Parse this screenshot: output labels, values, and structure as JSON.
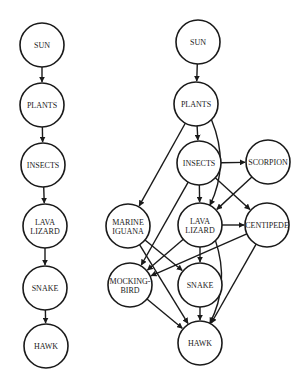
{
  "diagram": {
    "colors": {
      "stroke": "#1a1a1a",
      "background": "#ffffff",
      "node_fill": "#ffffff"
    },
    "food_chain": {
      "nodes": [
        {
          "id": "sun",
          "lines": [
            "SUN"
          ],
          "x": 42,
          "y": 45
        },
        {
          "id": "plants",
          "lines": [
            "PLANTS"
          ],
          "x": 42,
          "y": 105
        },
        {
          "id": "insects",
          "lines": [
            "INSECTS"
          ],
          "x": 43,
          "y": 165
        },
        {
          "id": "lava_lizard",
          "lines": [
            "LAVA",
            "LIZARD"
          ],
          "x": 45,
          "y": 226
        },
        {
          "id": "snake",
          "lines": [
            "SNAKE"
          ],
          "x": 45,
          "y": 288
        },
        {
          "id": "hawk",
          "lines": [
            "HAWK"
          ],
          "x": 46,
          "y": 346
        }
      ],
      "edges": [
        [
          "sun",
          "plants"
        ],
        [
          "plants",
          "insects"
        ],
        [
          "insects",
          "lava_lizard"
        ],
        [
          "lava_lizard",
          "snake"
        ],
        [
          "snake",
          "hawk"
        ]
      ]
    },
    "food_web": {
      "nodes": [
        {
          "id": "sun",
          "lines": [
            "SUN"
          ],
          "x": 198,
          "y": 42
        },
        {
          "id": "plants",
          "lines": [
            "PLANTS"
          ],
          "x": 196,
          "y": 104
        },
        {
          "id": "insects",
          "lines": [
            "INSECTS"
          ],
          "x": 199,
          "y": 163
        },
        {
          "id": "scorpion",
          "lines": [
            "SCORPION"
          ],
          "x": 268,
          "y": 162
        },
        {
          "id": "marine_iguana",
          "lines": [
            "MARINE",
            "IGUANA"
          ],
          "x": 128,
          "y": 226
        },
        {
          "id": "lava_lizard",
          "lines": [
            "LAVA",
            "LIZARD"
          ],
          "x": 200,
          "y": 225
        },
        {
          "id": "centipede",
          "lines": [
            "CENTIPEDE"
          ],
          "x": 267,
          "y": 225
        },
        {
          "id": "mockingbird",
          "lines": [
            "MOCKING-",
            "BIRD"
          ],
          "x": 130,
          "y": 285
        },
        {
          "id": "snake",
          "lines": [
            "SNAKE"
          ],
          "x": 200,
          "y": 285
        },
        {
          "id": "hawk",
          "lines": [
            "HAWK"
          ],
          "x": 200,
          "y": 343
        }
      ],
      "edges": [
        [
          "sun",
          "plants"
        ],
        [
          "plants",
          "insects"
        ],
        [
          "plants",
          "marine_iguana"
        ],
        [
          "plants",
          "lava_lizard",
          "curve-right"
        ],
        [
          "insects",
          "scorpion"
        ],
        [
          "insects",
          "lava_lizard"
        ],
        [
          "insects",
          "centipede"
        ],
        [
          "insects",
          "mockingbird"
        ],
        [
          "scorpion",
          "lava_lizard"
        ],
        [
          "lava_lizard",
          "centipede"
        ],
        [
          "lava_lizard",
          "mockingbird"
        ],
        [
          "lava_lizard",
          "snake"
        ],
        [
          "lava_lizard",
          "hawk",
          "curve-right"
        ],
        [
          "centipede",
          "mockingbird"
        ],
        [
          "centipede",
          "hawk"
        ],
        [
          "marine_iguana",
          "snake"
        ],
        [
          "marine_iguana",
          "hawk"
        ],
        [
          "mockingbird",
          "hawk"
        ],
        [
          "snake",
          "hawk"
        ]
      ]
    },
    "node_radius": 22
  }
}
